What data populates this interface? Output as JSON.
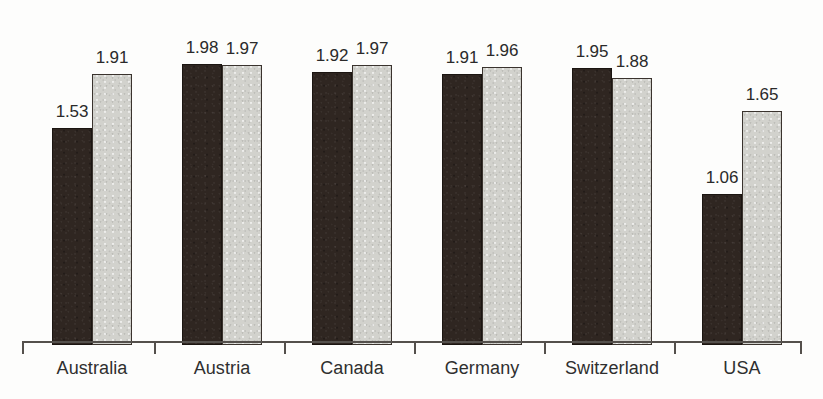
{
  "chart_data": {
    "type": "bar",
    "title": "",
    "subtitle": "",
    "xlabel": "",
    "ylabel": "",
    "ylim": [
      0,
      2.0
    ],
    "grid": false,
    "legend_position": "none",
    "axis_visible": [
      "x"
    ],
    "value_labels_shown": true,
    "value_label_format": "0.00",
    "categories": [
      "Australia",
      "Austria",
      "Canada",
      "Germany",
      "Switzerland",
      "USA"
    ],
    "series": [
      {
        "name": "series-1",
        "color": "#2f2621",
        "fill": "dark",
        "values": [
          1.53,
          1.98,
          1.92,
          1.91,
          1.95,
          1.06
        ]
      },
      {
        "name": "series-2",
        "color": "#d2d2cd",
        "fill": "light",
        "values": [
          1.91,
          1.97,
          1.97,
          1.96,
          1.88,
          1.65
        ]
      }
    ],
    "points": [
      {
        "category": "Australia",
        "dark": "1.53",
        "light": "1.91"
      },
      {
        "category": "Austria",
        "dark": "1.98",
        "light": "1.97"
      },
      {
        "category": "Canada",
        "dark": "1.92",
        "light": "1.97"
      },
      {
        "category": "Germany",
        "dark": "1.91",
        "light": "1.96"
      },
      {
        "category": "Switzerland",
        "dark": "1.95",
        "light": "1.88"
      },
      {
        "category": "USA",
        "dark": "1.06",
        "light": "1.65"
      }
    ]
  },
  "style": {
    "background": "#fdfdfc",
    "axis_color": "#54504c",
    "label_color": "#2f2f2f",
    "dark_bar_color": "#2f2621",
    "light_bar_color": "#d2d2cd"
  },
  "geometry": {
    "baseline_y": 341,
    "px_per_unit": 142,
    "bar_width": 40,
    "group_starts": [
      52,
      182,
      312,
      442,
      572,
      702
    ],
    "tick_x": [
      22,
      154,
      284,
      414,
      544,
      674,
      800
    ],
    "label_centers": [
      92,
      222,
      352,
      482,
      612,
      742
    ]
  }
}
